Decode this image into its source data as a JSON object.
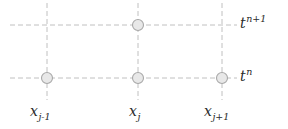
{
  "figure": {
    "name": "finite-difference-stencil",
    "width": 288,
    "height": 129,
    "background_color": "#ffffff"
  },
  "style": {
    "line_color": "#b9b9b9",
    "line_width": 0.9,
    "dash_pattern": "5,3",
    "node_fill": "#e8e8e8",
    "node_stroke": "#a8a8a8",
    "node_stroke_width": 1.1,
    "node_radius": 5.5,
    "text_color": "#2b2b2b"
  },
  "time_levels": [
    {
      "id": "t-np1",
      "base": "t",
      "superscript": "n+1",
      "label_text": "t",
      "y": 25,
      "line_x_start": 10,
      "line_x_end": 237
    },
    {
      "id": "t-n",
      "base": "t",
      "superscript": "n",
      "label_text": "t",
      "y": 78,
      "line_x_start": 10,
      "line_x_end": 237
    }
  ],
  "space_points": [
    {
      "id": "x-jm1",
      "base": "x",
      "subscript": "j-1",
      "label_text": "x",
      "x": 47,
      "line_y_start": 3,
      "line_y_end": 100
    },
    {
      "id": "x-j",
      "base": "x",
      "subscript": "j",
      "label_text": "x",
      "x": 138,
      "line_y_start": 3,
      "line_y_end": 100
    },
    {
      "id": "x-jp1",
      "base": "x",
      "subscript": "j+1",
      "label_text": "x",
      "x": 222,
      "line_y_start": 3,
      "line_y_end": 100
    }
  ],
  "nodes": [
    {
      "id": "node-j-np1",
      "x": 138,
      "y": 25,
      "space": "x_j",
      "time": "t^{n+1}"
    },
    {
      "id": "node-jm1-n",
      "x": 47,
      "y": 78,
      "space": "x_{j-1}",
      "time": "t^n"
    },
    {
      "id": "node-j-n",
      "x": 138,
      "y": 78,
      "space": "x_j",
      "time": "t^n"
    },
    {
      "id": "node-jp1-n",
      "x": 222,
      "y": 78,
      "space": "x_{j+1}",
      "time": "t^n"
    }
  ]
}
